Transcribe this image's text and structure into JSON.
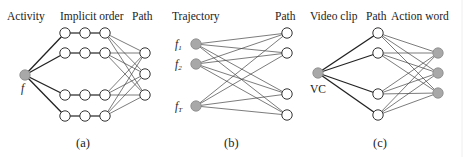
{
  "panels": [
    {
      "id": "a",
      "caption": "(a)",
      "headers": {
        "left": "Activity",
        "middle": "Implicit order",
        "right": "Path"
      },
      "source_label": "f",
      "source": {
        "x": 25,
        "y": 75
      },
      "chain_columns_x": [
        65,
        85,
        105
      ],
      "chain_rows_y": [
        33,
        53,
        95,
        116
      ],
      "targets": [
        {
          "x": 145,
          "y": 53
        },
        {
          "x": 145,
          "y": 74
        },
        {
          "x": 145,
          "y": 95
        }
      ]
    },
    {
      "id": "b",
      "caption": "(b)",
      "headers": {
        "left": "Trajectory",
        "right": "Path"
      },
      "source_labels": [
        "f1",
        "f2",
        "fT"
      ],
      "sources": [
        {
          "x": 196,
          "y": 44
        },
        {
          "x": 196,
          "y": 64
        },
        {
          "x": 196,
          "y": 106
        }
      ],
      "targets": [
        {
          "x": 287,
          "y": 33
        },
        {
          "x": 287,
          "y": 53
        },
        {
          "x": 287,
          "y": 94
        },
        {
          "x": 287,
          "y": 115
        }
      ]
    },
    {
      "id": "c",
      "caption": "(c)",
      "headers": {
        "left": "Video clip",
        "middle": "Path",
        "right": "Action word"
      },
      "source_label": "VC",
      "source": {
        "x": 318,
        "y": 73
      },
      "middle": [
        {
          "x": 378,
          "y": 33
        },
        {
          "x": 378,
          "y": 53
        },
        {
          "x": 378,
          "y": 94
        },
        {
          "x": 378,
          "y": 115
        }
      ],
      "targets": [
        {
          "x": 438,
          "y": 53
        },
        {
          "x": 438,
          "y": 73
        },
        {
          "x": 438,
          "y": 93
        }
      ]
    }
  ],
  "colors": {
    "filled_node": "#a8a8a8",
    "open_node": "#ffffff",
    "edge": "#222222"
  }
}
